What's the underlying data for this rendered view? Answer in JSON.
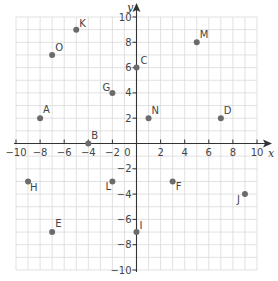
{
  "chart_data": {
    "type": "scatter",
    "title": "",
    "xlabel": "x",
    "ylabel": "y",
    "xlim": [
      -10,
      10
    ],
    "ylim": [
      -10,
      10
    ],
    "grid": true,
    "x_ticks": [
      -10,
      -8,
      -6,
      -4,
      -2,
      0,
      2,
      4,
      6,
      8,
      10
    ],
    "y_ticks": [
      -10,
      -8,
      -6,
      -4,
      -2,
      2,
      4,
      6,
      8,
      10
    ],
    "x_tick_labels": [
      "−10",
      "−8",
      "−6",
      "−4",
      "−2",
      "0",
      "2",
      "4",
      "6",
      "8",
      "10"
    ],
    "y_tick_labels": [
      "−10",
      "−8",
      "−6",
      "−4",
      "−2",
      "2",
      "4",
      "6",
      "8",
      "10"
    ],
    "points": [
      {
        "label": "A",
        "x": -8,
        "y": 2,
        "lx": 3,
        "ly": -5
      },
      {
        "label": "B",
        "x": -4,
        "y": 0,
        "lx": 3,
        "ly": -5
      },
      {
        "label": "C",
        "x": 0,
        "y": 6,
        "lx": 4,
        "ly": -4
      },
      {
        "label": "D",
        "x": 7,
        "y": 2,
        "lx": 3,
        "ly": -4
      },
      {
        "label": "E",
        "x": -7,
        "y": -7,
        "lx": 3,
        "ly": -5
      },
      {
        "label": "F",
        "x": 3,
        "y": -3,
        "lx": 3,
        "ly": 9
      },
      {
        "label": "G",
        "x": -2,
        "y": 4,
        "lx": -10,
        "ly": -2
      },
      {
        "label": "H",
        "x": -9,
        "y": -3,
        "lx": 2,
        "ly": 10
      },
      {
        "label": "I",
        "x": 0,
        "y": -7,
        "lx": 3,
        "ly": -3
      },
      {
        "label": "J",
        "x": 9,
        "y": -4,
        "lx": -8,
        "ly": 9
      },
      {
        "label": "K",
        "x": -5,
        "y": 9,
        "lx": 3,
        "ly": -3
      },
      {
        "label": "L",
        "x": -2,
        "y": -3,
        "lx": -7,
        "ly": 9
      },
      {
        "label": "M",
        "x": 5,
        "y": 8,
        "lx": 3,
        "ly": -4
      },
      {
        "label": "N",
        "x": 1,
        "y": 2,
        "lx": 3,
        "ly": -4
      },
      {
        "label": "O",
        "x": -7,
        "y": 7,
        "lx": 3,
        "ly": -4
      }
    ],
    "colors": {
      "point": "#6b6b6b",
      "grid": "#d9d9d9",
      "axis": "#333333"
    }
  }
}
